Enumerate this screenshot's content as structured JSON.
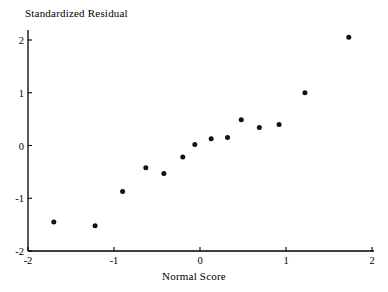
{
  "chart_data": {
    "type": "scatter",
    "title": "",
    "xlabel": "Normal Score",
    "ylabel": "Standardized Residual",
    "xlim": [
      -2,
      2
    ],
    "ylim": [
      -2,
      2
    ],
    "xticks": [
      -2,
      -1,
      0,
      1,
      2
    ],
    "xtick_labels": [
      "-2",
      "-1",
      "0",
      "1",
      "2"
    ],
    "yticks": [
      -2,
      -1,
      0,
      1,
      2
    ],
    "ytick_labels": [
      "-2",
      "-1",
      "0",
      "1",
      "2"
    ],
    "grid": false,
    "legend": null,
    "marker": {
      "shape": "circle",
      "color": "#111111",
      "size_px": 5
    },
    "axis_color": "#000000",
    "background_color": "#ffffff",
    "series": [
      {
        "name": "Normal probability plot points",
        "points": [
          {
            "x": -1.7,
            "y": -1.45
          },
          {
            "x": -1.22,
            "y": -1.52
          },
          {
            "x": -0.9,
            "y": -0.87
          },
          {
            "x": -0.63,
            "y": -0.42
          },
          {
            "x": -0.42,
            "y": -0.53
          },
          {
            "x": -0.2,
            "y": -0.22
          },
          {
            "x": -0.06,
            "y": 0.02
          },
          {
            "x": 0.13,
            "y": 0.13
          },
          {
            "x": 0.32,
            "y": 0.15
          },
          {
            "x": 0.48,
            "y": 0.49
          },
          {
            "x": 0.69,
            "y": 0.34
          },
          {
            "x": 0.92,
            "y": 0.4
          },
          {
            "x": 1.22,
            "y": 1.0
          },
          {
            "x": 1.73,
            "y": 2.05
          }
        ]
      }
    ]
  },
  "plot_geometry": {
    "origin_x_px": 28,
    "origin_y_px": 251,
    "x_unit_px": 86,
    "y_unit_px": 52.75,
    "x_axis_right_px": 374,
    "y_axis_top_px": 30
  }
}
